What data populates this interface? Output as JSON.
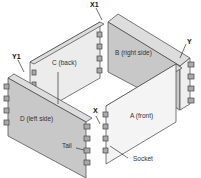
{
  "diagram": {
    "panels": [
      {
        "id": "A",
        "label": "A (front)"
      },
      {
        "id": "B",
        "label": "B (right side)"
      },
      {
        "id": "C",
        "label": "C (back)"
      },
      {
        "id": "D",
        "label": "D (left side)"
      }
    ],
    "corner_labels": {
      "x1": "X1",
      "y1": "Y1",
      "x": "X",
      "y": "Y"
    },
    "callouts": {
      "tail": "Tail",
      "socket": "Socket"
    },
    "colors": {
      "panel_face": "#c8c8c8",
      "panel_light": "#f0f0f0",
      "edge": "#444444"
    }
  }
}
